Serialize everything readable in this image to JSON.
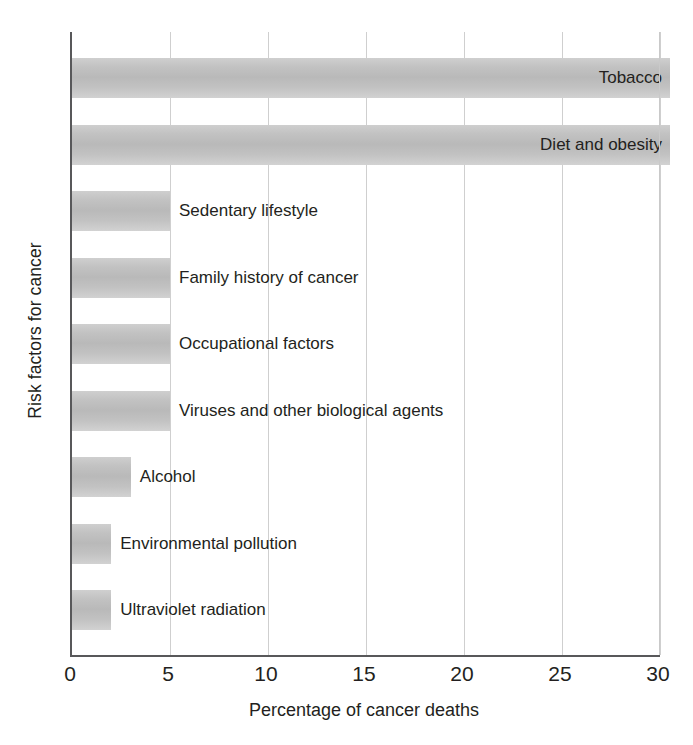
{
  "chart_data": {
    "type": "bar",
    "orientation": "horizontal",
    "title": "",
    "xlabel": "Percentage of cancer deaths",
    "ylabel": "Risk factors for cancer",
    "xlim": [
      0,
      30
    ],
    "xticks": [
      0,
      5,
      10,
      15,
      20,
      25,
      30
    ],
    "xtick_labels": [
      "0",
      "5",
      "10",
      "15",
      "20",
      "25",
      "30"
    ],
    "grid": "vertical",
    "legend": "none",
    "bar_color": "#c2c2c2",
    "axis_color": "#58585a",
    "categories": [
      "Tobacco",
      "Diet and obesity",
      "Sedentary lifestyle",
      "Family history of cancer",
      "Occupational factors",
      "Viruses and other biological agents",
      "Alcohol",
      "Environmental pollution",
      "Ultraviolet radiation"
    ],
    "values": [
      30,
      30,
      5,
      5,
      5,
      5,
      3,
      2,
      2
    ],
    "label_placement": [
      "inside",
      "inside",
      "outside",
      "outside",
      "outside",
      "outside",
      "outside",
      "outside",
      "outside"
    ]
  },
  "axes": {
    "x_title": "Percentage of cancer deaths",
    "y_title": "Risk factors for cancer",
    "ticks": [
      {
        "value": 0,
        "label": "0"
      },
      {
        "value": 5,
        "label": "5"
      },
      {
        "value": 10,
        "label": "10"
      },
      {
        "value": 15,
        "label": "15"
      },
      {
        "value": 20,
        "label": "20"
      },
      {
        "value": 25,
        "label": "25"
      },
      {
        "value": 30,
        "label": "30"
      }
    ]
  },
  "bars": [
    {
      "label": "Tobacco",
      "value": 30,
      "inside": true
    },
    {
      "label": "Diet and obesity",
      "value": 30,
      "inside": true
    },
    {
      "label": "Sedentary lifestyle",
      "value": 5,
      "inside": false
    },
    {
      "label": "Family history of cancer",
      "value": 5,
      "inside": false
    },
    {
      "label": "Occupational factors",
      "value": 5,
      "inside": false
    },
    {
      "label": "Viruses and other biological agents",
      "value": 5,
      "inside": false
    },
    {
      "label": "Alcohol",
      "value": 3,
      "inside": false
    },
    {
      "label": "Environmental pollution",
      "value": 2,
      "inside": false
    },
    {
      "label": "Ultraviolet radiation",
      "value": 2,
      "inside": false
    }
  ]
}
